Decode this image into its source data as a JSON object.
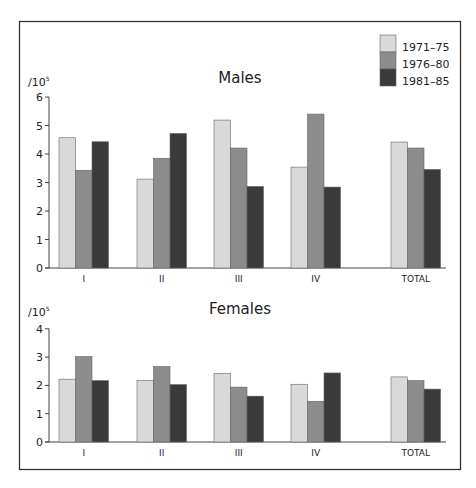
{
  "colors": {
    "frame": "#333333",
    "axis": "#444444",
    "series": [
      "#d9d9d9",
      "#8c8c8c",
      "#3a3a3a"
    ],
    "bar_stroke": "#666666"
  },
  "legend": {
    "items": [
      {
        "label": "1971–75"
      },
      {
        "label": "1976–80"
      },
      {
        "label": "1981–85"
      }
    ]
  },
  "chart_data": [
    {
      "type": "bar",
      "title": "Males",
      "ylabel": "/10^5",
      "unit_base": "/10",
      "unit_exp": "5",
      "xlabel": "",
      "ylim": [
        0,
        6
      ],
      "yticks": [
        0,
        1,
        2,
        3,
        4,
        5,
        6
      ],
      "categories": [
        "I",
        "II",
        "III",
        "IV",
        "TOTAL"
      ],
      "series": [
        {
          "name": "1971–75",
          "values": [
            4.57,
            3.12,
            5.19,
            3.54,
            4.42
          ]
        },
        {
          "name": "1976–80",
          "values": [
            3.43,
            3.85,
            4.21,
            5.4,
            4.21
          ]
        },
        {
          "name": "1981–85",
          "values": [
            4.43,
            4.72,
            2.86,
            2.84,
            3.46
          ]
        }
      ],
      "grid": false,
      "legend_position": "top-right"
    },
    {
      "type": "bar",
      "title": "Females",
      "ylabel": "/10^5",
      "unit_base": "/10",
      "unit_exp": "5",
      "xlabel": "",
      "ylim": [
        0,
        4
      ],
      "yticks": [
        0,
        1,
        2,
        3,
        4
      ],
      "categories": [
        "I",
        "II",
        "III",
        "IV",
        "TOTAL"
      ],
      "series": [
        {
          "name": "1971–75",
          "values": [
            2.22,
            2.17,
            2.42,
            2.04,
            2.3
          ]
        },
        {
          "name": "1976–80",
          "values": [
            3.02,
            2.67,
            1.94,
            1.44,
            2.17
          ]
        },
        {
          "name": "1981–85",
          "values": [
            2.17,
            2.03,
            1.62,
            2.44,
            1.87
          ]
        }
      ],
      "grid": false
    }
  ]
}
